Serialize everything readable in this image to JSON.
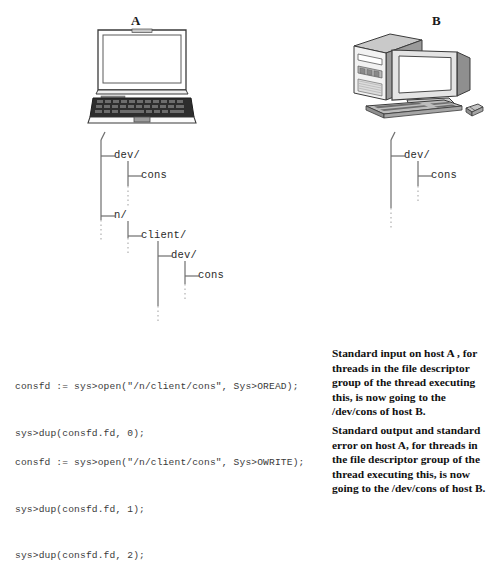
{
  "figure": {
    "hosts": [
      {
        "id": "A",
        "label": "A",
        "device": "laptop-computer"
      },
      {
        "id": "B",
        "label": "B",
        "device": "desktop-computer"
      }
    ],
    "trees": {
      "host_a": {
        "root": "/",
        "nodes": [
          {
            "name": "dev/",
            "depth": 1
          },
          {
            "name": "cons",
            "depth": 2
          },
          {
            "name": "n/",
            "depth": 1
          },
          {
            "name": "client/",
            "depth": 2
          },
          {
            "name": "dev/",
            "depth": 3
          },
          {
            "name": "cons",
            "depth": 4
          }
        ]
      },
      "host_b": {
        "root": "/",
        "nodes": [
          {
            "name": "dev/",
            "depth": 1
          },
          {
            "name": "cons",
            "depth": 2
          }
        ]
      }
    },
    "code_blocks": [
      {
        "id": "oread",
        "lines": [
          "consfd := sys>open(\"/n/client/cons\", Sys>OREAD);",
          "sys>dup(consfd.fd, 0);"
        ]
      },
      {
        "id": "owrite",
        "lines": [
          "consfd := sys>open(\"/n/client/cons\", Sys>OWRITE);",
          "sys>dup(consfd.fd, 1);",
          "sys>dup(consfd.fd, 2);"
        ]
      }
    ],
    "descriptions": [
      {
        "id": "stdin-desc",
        "lines": [
          "Standard input on host A , for",
          "threads in the file descriptor",
          "group of the thread executing",
          "this, is now going to the",
          "/dev/cons of host B."
        ]
      },
      {
        "id": "stdout-desc",
        "lines": [
          "Standard output and standard",
          "error on host A, for threads in",
          "the file descriptor group of the",
          "thread executing this, is now",
          "going to the /dev/cons of host B."
        ]
      }
    ],
    "colors": {
      "background": "#ffffff",
      "line": "#6e6e6e",
      "dotted_line": "#b0b0b0",
      "code_text": "#3a3a3a",
      "desc_text": "#111111",
      "device_outline": "#3b3b3b",
      "device_fill": "#ffffff",
      "device_shade": "#9a9a9a",
      "device_dark": "#3a3a3a"
    }
  }
}
